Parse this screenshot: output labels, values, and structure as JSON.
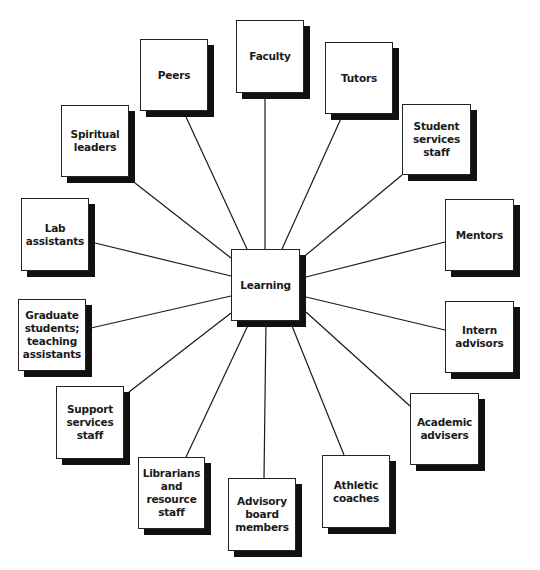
{
  "diagram": {
    "type": "hub-and-spoke",
    "center": {
      "label": "Learning",
      "box": [
        231,
        249,
        69,
        72
      ]
    },
    "nodes": [
      {
        "id": "faculty",
        "label": "Faculty",
        "box": [
          236,
          20,
          68,
          73
        ],
        "anchor": [
          265,
          93
        ]
      },
      {
        "id": "tutors",
        "label": "Tutors",
        "box": [
          325,
          42,
          68,
          72
        ],
        "anchor": [
          343,
          114
        ]
      },
      {
        "id": "student-services",
        "label": "Student\nservices\nstaff",
        "box": [
          402,
          104,
          69,
          71
        ],
        "anchor": [
          402,
          175
        ]
      },
      {
        "id": "mentors",
        "label": "Mentors",
        "box": [
          445,
          199,
          69,
          72
        ],
        "anchor": [
          445,
          242
        ]
      },
      {
        "id": "intern-advisors",
        "label": "Intern\nadvisors",
        "box": [
          445,
          301,
          69,
          72
        ],
        "anchor": [
          445,
          330
        ]
      },
      {
        "id": "academic-advisers",
        "label": "Academic\nadvisers",
        "box": [
          410,
          393,
          69,
          72
        ],
        "anchor": [
          410,
          406
        ]
      },
      {
        "id": "athletic-coaches",
        "label": "Athletic\ncoaches",
        "box": [
          322,
          455,
          68,
          73
        ],
        "anchor": [
          344,
          455
        ]
      },
      {
        "id": "advisory-board",
        "label": "Advisory\nboard\nmembers",
        "box": [
          228,
          478,
          68,
          73
        ],
        "anchor": [
          264,
          478
        ]
      },
      {
        "id": "librarians",
        "label": "Librarians\nand\nresource\nstaff",
        "box": [
          138,
          457,
          67,
          72
        ],
        "anchor": [
          186,
          457
        ]
      },
      {
        "id": "support-services",
        "label": "Support\nservices\nstaff",
        "box": [
          56,
          386,
          68,
          73
        ],
        "anchor": [
          129,
          392
        ]
      },
      {
        "id": "graduate-students",
        "label": "Graduate\nstudents;\nteaching\nassistants",
        "box": [
          18,
          299,
          68,
          72
        ],
        "anchor": [
          91,
          328
        ]
      },
      {
        "id": "lab-assistants",
        "label": "Lab\nassistants",
        "box": [
          21,
          198,
          68,
          73
        ],
        "anchor": [
          95,
          243
        ]
      },
      {
        "id": "spiritual-leaders",
        "label": "Spiritual\nleaders",
        "box": [
          61,
          105,
          68,
          72
        ],
        "anchor": [
          135,
          183
        ]
      },
      {
        "id": "peers",
        "label": "Peers",
        "box": [
          140,
          39,
          68,
          72
        ],
        "anchor": [
          186,
          117
        ]
      }
    ],
    "center_anchors": [
      [
        265,
        249
      ],
      [
        282,
        249
      ],
      [
        300,
        260
      ],
      [
        306,
        277
      ],
      [
        306,
        297
      ],
      [
        306,
        312
      ],
      [
        290,
        321
      ],
      [
        266,
        321
      ],
      [
        250,
        321
      ],
      [
        231,
        313
      ],
      [
        231,
        296
      ],
      [
        231,
        276
      ],
      [
        231,
        258
      ],
      [
        247,
        249
      ]
    ]
  }
}
